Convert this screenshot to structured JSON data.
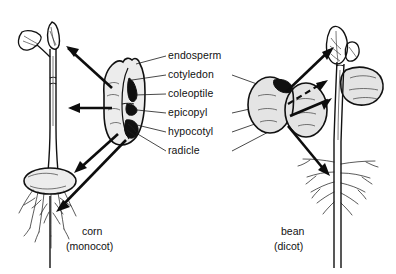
{
  "figure": {
    "background_color": "#ffffff",
    "ink_color": "#111111",
    "seed_fill_color": "#ececec",
    "dark_tissue_color": "#101010"
  },
  "labels": [
    {
      "id": "endosperm",
      "text": "endosperm",
      "x": 168,
      "y": 59
    },
    {
      "id": "cotyledon",
      "text": "cotyledon",
      "x": 168,
      "y": 78
    },
    {
      "id": "coleoptile",
      "text": "coleoptile",
      "x": 168,
      "y": 97
    },
    {
      "id": "epicopyl",
      "text": "epicopyl",
      "x": 168,
      "y": 116
    },
    {
      "id": "hypocotyl",
      "text": "hypocotyl",
      "x": 168,
      "y": 135
    },
    {
      "id": "radicle",
      "text": "radicle",
      "x": 168,
      "y": 154
    }
  ],
  "captions": {
    "left": {
      "name": "corn",
      "group": "(monocot)"
    },
    "right": {
      "name": "bean",
      "group": "(dicot)"
    }
  },
  "specimens": [
    {
      "id": "corn",
      "common_name": "corn",
      "classification": "monocot",
      "side": "left",
      "structures": [
        "seed kernel",
        "coleoptile",
        "first leaf",
        "fibrous roots"
      ],
      "root_type": "fibrous",
      "cotyledon_count": 1
    },
    {
      "id": "bean",
      "common_name": "bean",
      "classification": "dicot",
      "side": "right",
      "structures": [
        "two cotyledons",
        "epicotyl",
        "first leaves",
        "taproot"
      ],
      "root_type": "taproot",
      "cotyledon_count": 2
    }
  ],
  "arrows": {
    "corn_count": 4,
    "bean_count": 4,
    "style": "solid filled triangles",
    "dashed_present": true,
    "description": "thick arrows radiate from each seed toward the seedling stages"
  }
}
